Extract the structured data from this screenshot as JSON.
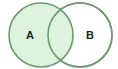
{
  "diagram": {
    "type": "venn",
    "sets": [
      {
        "id": "A",
        "label": "A",
        "filled": true,
        "fill": "#d9f2d9",
        "stroke": "#6f9a6f"
      },
      {
        "id": "B",
        "label": "B",
        "filled": false,
        "fill": "#ffffff",
        "stroke": "#6f9a6f"
      }
    ],
    "highlighted_region": "A"
  }
}
